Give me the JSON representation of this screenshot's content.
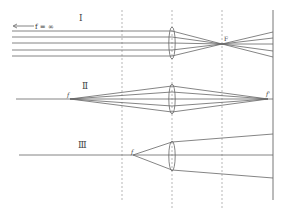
{
  "colors": {
    "line": "#666666",
    "dashed": "#888888",
    "text": "#333333"
  },
  "cases": [
    {
      "id": "I",
      "label": "Ⅰ",
      "annotation": "f = ∞",
      "focus_label": "F",
      "description": "Parallel rays from infinity converge at focal point F"
    },
    {
      "id": "II",
      "label": "Ⅱ",
      "source_label": "f",
      "image_label": "f'",
      "description": "Point source f imaged to point f'"
    },
    {
      "id": "III",
      "label": "Ⅲ",
      "source_label": "f",
      "description": "Point source at focal point produces diverging beam"
    }
  ],
  "guides": {
    "dashed_lines": 3,
    "screen": "solid vertical line at right"
  }
}
